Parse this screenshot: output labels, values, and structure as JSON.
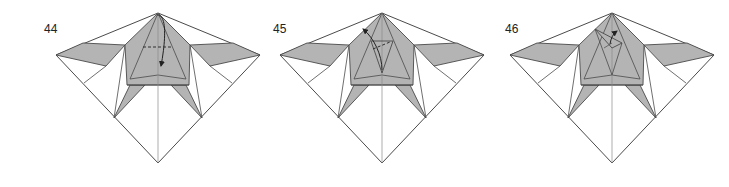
{
  "colors": {
    "paper_white": "#ffffff",
    "paper_gray": "#b4b4b4",
    "line": "#4a4a4a",
    "crease": "#8a8a8a",
    "arrow": "#222222"
  },
  "steps": [
    {
      "label": "44",
      "label_pos": [
        44,
        22
      ],
      "dx": 0,
      "variant": "valley-fold-tip-down"
    },
    {
      "label": "45",
      "label_pos": [
        273,
        22
      ],
      "dx": 224,
      "variant": "fold-flap-up-left"
    },
    {
      "label": "46",
      "label_pos": [
        505,
        22
      ],
      "dx": 454,
      "variant": "fold-flap-back-right"
    }
  ],
  "base_geometry": {
    "apex": [
      158,
      13
    ],
    "bottom": [
      158,
      163
    ],
    "left_outer": [
      56,
      55
    ],
    "right_outer": [
      260,
      55
    ],
    "left_wing": [
      [
        56,
        55
      ],
      [
        83,
        43
      ],
      [
        125,
        45
      ],
      [
        106,
        66
      ]
    ],
    "right_wing": [
      [
        260,
        55
      ],
      [
        233,
        43
      ],
      [
        190,
        45
      ],
      [
        210,
        66
      ]
    ],
    "left_white_tri": [
      [
        56,
        55
      ],
      [
        106,
        66
      ],
      [
        84,
        83
      ]
    ],
    "right_white_tri": [
      [
        260,
        55
      ],
      [
        210,
        66
      ],
      [
        232,
        83
      ]
    ],
    "body": [
      [
        158,
        13
      ],
      [
        190,
        45
      ],
      [
        189,
        85
      ],
      [
        127,
        85
      ],
      [
        125,
        45
      ]
    ],
    "band": [
      [
        127,
        85
      ],
      [
        189,
        85
      ],
      [
        186,
        79
      ],
      [
        130,
        79
      ]
    ],
    "left_leg": [
      [
        130,
        85
      ],
      [
        145,
        85
      ],
      [
        114,
        118
      ]
    ],
    "right_leg": [
      [
        186,
        85
      ],
      [
        171,
        85
      ],
      [
        202,
        118
      ]
    ],
    "inner_v": [
      [
        130,
        79
      ],
      [
        158,
        75
      ],
      [
        186,
        79
      ]
    ]
  }
}
